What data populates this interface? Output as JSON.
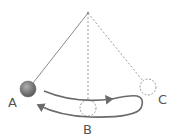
{
  "diagram": {
    "pivot": {
      "x": 88,
      "y": 13
    },
    "positions": [
      {
        "id": "A",
        "label": "A",
        "x": 28,
        "y": 89,
        "style": "solid-ball"
      },
      {
        "id": "B",
        "label": "B",
        "x": 88,
        "y": 108,
        "style": "dashed-ghost"
      },
      {
        "id": "C",
        "label": "C",
        "x": 148,
        "y": 87,
        "style": "dashed-ghost"
      }
    ],
    "colors": {
      "string": "#8a8a8a",
      "dashed": "#9a9a9a",
      "arrow": "#6b6b6b",
      "ball": "#7a7a7a",
      "label": "#555555"
    }
  }
}
